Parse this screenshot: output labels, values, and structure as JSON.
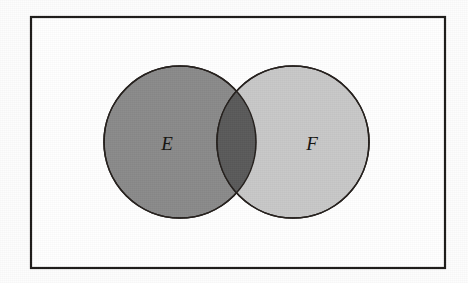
{
  "figure": {
    "kind": "venn-diagram",
    "canvas": {
      "width": 468,
      "height": 283,
      "background": "#fdfdfd"
    }
  },
  "frame": {
    "name": "universal-set-rectangle",
    "x": 31,
    "y": 17,
    "width": 414,
    "height": 251,
    "stroke": "#1d1b19",
    "stroke_width": 2.2,
    "fill": "#ffffff"
  },
  "sets": [
    {
      "id": "E",
      "label": "E",
      "cx": 180,
      "cy": 142,
      "r": 76,
      "fill": "#8a8a8a",
      "stroke": "#241f1c",
      "stroke_width": 1.6,
      "label_x": 167,
      "label_y": 146
    },
    {
      "id": "F",
      "label": "F",
      "cx": 293,
      "cy": 142,
      "r": 76,
      "fill": "#c8c8c8",
      "stroke": "#241f1c",
      "stroke_width": 1.6,
      "label_x": 312,
      "label_y": 146
    }
  ],
  "intersection": {
    "name": "E-intersect-F",
    "fill": "#5a5a5a",
    "top_point": {
      "x": 243,
      "y": 83
    },
    "bottom_point": {
      "x": 243,
      "y": 203
    }
  }
}
